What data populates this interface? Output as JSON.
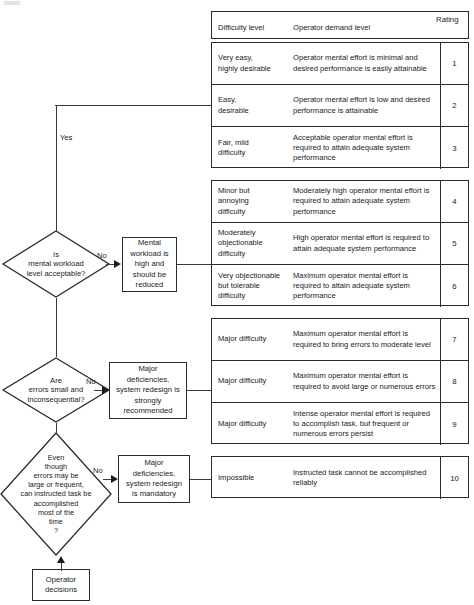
{
  "table": {
    "header": {
      "difficulty": "Difficulty level",
      "demand": "Operator demand level",
      "rating": "Rating"
    },
    "groups": [
      {
        "name": "acceptable-workload",
        "rows": [
          {
            "difficulty": "Very easy,\nhighly desirable",
            "demand": "Operator mental effort is minimal and desired performance is easily attainable",
            "rating": "1"
          },
          {
            "difficulty": "Easy,\ndesirable",
            "demand": "Operator mental effort is low and desired performance is attainable",
            "rating": "2"
          },
          {
            "difficulty": "Fair, mild\ndifficulty",
            "demand": "Acceptable operator mental effort is required to attain adequate system performance",
            "rating": "3"
          }
        ]
      },
      {
        "name": "high-workload",
        "rows": [
          {
            "difficulty": "Minor but\nannoying\ndifficulty",
            "demand": "Moderately high operator mental effort is required to attain adequate system performance",
            "rating": "4"
          },
          {
            "difficulty": "Moderately\nobjectionable\ndifficulty",
            "demand": "High operator mental effort is required to attain adequate system performance",
            "rating": "5"
          },
          {
            "difficulty": "Very objectionable\nbut tolerable\ndifficulty",
            "demand": "Maximum operator mental effort is required to attain adequate system performance",
            "rating": "6"
          }
        ]
      },
      {
        "name": "major-deficiencies-redesign-recommended",
        "rows": [
          {
            "difficulty": "Major difficulty",
            "demand": "Maximum operator mental effort is required to bring errors to moderate level",
            "rating": "7"
          },
          {
            "difficulty": "Major difficulty",
            "demand": "Maximum operator mental effort is required to avoid large or numerous errors",
            "rating": "8"
          },
          {
            "difficulty": "Major difficulty",
            "demand": "Intense operator mental effort is required to accomplish task, but frequent or numerous errors persist",
            "rating": "9"
          }
        ]
      },
      {
        "name": "impossible",
        "rows": [
          {
            "difficulty": "Impossible",
            "demand": "Instructed task cannot be accomplished reliably",
            "rating": "10"
          }
        ]
      }
    ]
  },
  "flow": {
    "decisions": [
      {
        "id": "mental-workload-acceptable",
        "text": "Is\nmental workload\nlevel acceptable?"
      },
      {
        "id": "errors-small-inconsequential",
        "text": "Are\nerrors small and\ninconsequential?"
      },
      {
        "id": "task-accomplished-most-of-time",
        "text": "Even\nthough\nerrors may be\nlarge or frequent,\ncan instructed task be\naccomplished\nmost of the\ntime\n?"
      }
    ],
    "outcomes": [
      {
        "id": "mental-workload-high",
        "text": "Mental\nworkload is\nhigh and\nshould be\nreduced"
      },
      {
        "id": "redesign-strongly-recommended",
        "text": "Major\ndeficiencies,\nsystem redesign is\nstrongly\nrecommended"
      },
      {
        "id": "redesign-mandatory",
        "text": "Major\ndeficiencies,\nsystem redesign\nis mandatory"
      }
    ],
    "start": {
      "id": "operator-decisions",
      "text": "Operator\ndecisions"
    },
    "edge_labels": {
      "yes": "Yes",
      "no_1": "No",
      "no_2": "No",
      "no_3": "No"
    }
  }
}
